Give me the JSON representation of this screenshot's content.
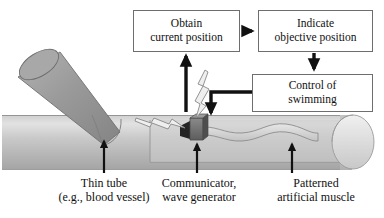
{
  "figure": {
    "type": "schematic-diagram"
  },
  "flowchart": {
    "boxes": [
      {
        "id": "obtain",
        "line1": "Obtain",
        "line2": "current position"
      },
      {
        "id": "indicate",
        "line1": "Indicate",
        "line2": "objective position"
      },
      {
        "id": "control",
        "line1": "Control of",
        "line2": "swimming"
      }
    ],
    "arrows": [
      {
        "name": "obtain-to-indicate",
        "direction": "right"
      },
      {
        "name": "indicate-to-control",
        "direction": "down"
      },
      {
        "name": "control-to-robot",
        "direction": "down-left-elbow"
      },
      {
        "name": "robot-to-obtain",
        "direction": "up"
      }
    ]
  },
  "callouts": [
    {
      "id": "thin-tube",
      "line1": "Thin tube",
      "line2": "(e.g., blood vessel)"
    },
    {
      "id": "communicator",
      "line1": "Communicator,",
      "line2": "wave generator"
    },
    {
      "id": "artificial-muscle",
      "line1": "Patterned",
      "line2": "artificial muscle"
    }
  ],
  "colors": {
    "tube_light": "#d9d9d9",
    "tube_mid": "#b9b9b9",
    "tube_dark": "#9a9a9a",
    "branch_tube": "#9c9c9c",
    "robot_body": "#6b6b6b",
    "robot_head": "#2e2e2e",
    "outline": "#5a5a5a",
    "arrow": "#111111",
    "box_border": "#6e6e6e",
    "background": "#ffffff"
  },
  "parts": [
    {
      "name": "main-tube"
    },
    {
      "name": "branch-tube"
    },
    {
      "name": "tube-end-cap"
    },
    {
      "name": "robot-communicator-body"
    },
    {
      "name": "patterned-artificial-muscle-ribbon"
    },
    {
      "name": "emitted-wave-upper"
    },
    {
      "name": "emitted-wave-lower"
    }
  ]
}
